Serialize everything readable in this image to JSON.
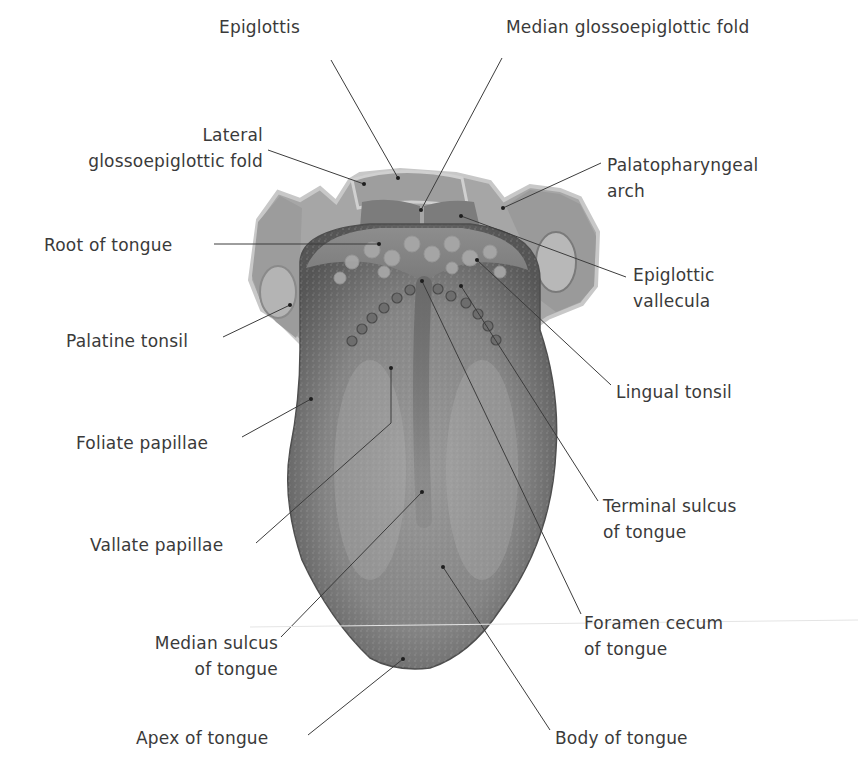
{
  "diagram": {
    "colors": {
      "background": "#ffffff",
      "text": "#3a3a3a",
      "leader_line": "#3c3c3c",
      "tongue_dark": "#5e5e5e",
      "tongue_mid": "#8a8a8a",
      "tongue_light": "#b9b9b9",
      "rim_light": "#d2d2d2"
    },
    "labels": [
      {
        "id": "epiglottis",
        "lines": [
          "Epiglottis"
        ],
        "anchor": [
          398,
          178
        ],
        "elbow": [
          331,
          60
        ],
        "text_pos": [
          219,
          14
        ],
        "align": "left"
      },
      {
        "id": "median-glossoepiglottic-fold",
        "lines": [
          "Median glossoepiglottic fold"
        ],
        "anchor": [
          421,
          210
        ],
        "elbow": [
          502,
          58
        ],
        "text_pos": [
          506,
          14
        ],
        "align": "left"
      },
      {
        "id": "lateral-glossoepiglottic-fold",
        "lines": [
          "Lateral",
          "glossoepiglottic fold"
        ],
        "anchor": [
          364,
          184
        ],
        "elbow": [
          268,
          150
        ],
        "text_pos": [
          0,
          122
        ],
        "align": "right",
        "right_edge": [
          263
        ]
      },
      {
        "id": "palatopharyngeal-arch",
        "lines": [
          "Palatopharyngeal",
          "arch"
        ],
        "anchor": [
          503,
          208
        ],
        "elbow": [
          601,
          163
        ],
        "text_pos": [
          607,
          152
        ],
        "align": "left"
      },
      {
        "id": "root-of-tongue",
        "lines": [
          "Root of tongue"
        ],
        "anchor": [
          379,
          244
        ],
        "elbow": [
          214,
          244
        ],
        "text_pos": [
          44,
          232
        ],
        "align": "left"
      },
      {
        "id": "epiglottic-vallecula",
        "lines": [
          "Epiglottic",
          "vallecula"
        ],
        "anchor": [
          461,
          216
        ],
        "elbow": [
          626,
          277
        ],
        "text_pos": [
          633,
          262
        ],
        "align": "left"
      },
      {
        "id": "palatine-tonsil",
        "lines": [
          "Palatine tonsil"
        ],
        "anchor": [
          290,
          305
        ],
        "elbow": [
          223,
          337
        ],
        "text_pos": [
          66,
          328
        ],
        "align": "left"
      },
      {
        "id": "lingual-tonsil",
        "lines": [
          "Lingual tonsil"
        ],
        "anchor": [
          477,
          260
        ],
        "elbow": [
          611,
          385
        ],
        "text_pos": [
          616,
          379
        ],
        "align": "left"
      },
      {
        "id": "foliate-papillae",
        "lines": [
          "Foliate papillae"
        ],
        "anchor": [
          311,
          399
        ],
        "elbow": [
          242,
          437
        ],
        "text_pos": [
          76,
          430
        ],
        "align": "left"
      },
      {
        "id": "vallate-papillae",
        "lines": [
          "Vallate papillae"
        ],
        "anchor": [
          391,
          368
        ],
        "elbow": [
          391,
          423
        ],
        "elbow2": [
          256,
          543
        ],
        "text_pos": [
          90,
          532
        ],
        "align": "left"
      },
      {
        "id": "terminal-sulcus-of-tongue",
        "lines": [
          "Terminal sulcus",
          "of tongue"
        ],
        "anchor": [
          461,
          286
        ],
        "elbow": [
          598,
          501
        ],
        "text_pos": [
          603,
          493
        ],
        "align": "left"
      },
      {
        "id": "median-sulcus-of-tongue",
        "lines": [
          "Median sulcus",
          "of tongue"
        ],
        "anchor": [
          422,
          492
        ],
        "elbow": [
          281,
          637
        ],
        "text_pos": [
          126,
          598
        ],
        "align": "right",
        "right_edge": [
          278
        ]
      },
      {
        "id": "foramen-cecum-of-tongue",
        "lines": [
          "Foramen cecum",
          "of tongue"
        ],
        "anchor": [
          422,
          281
        ],
        "elbow": [
          581,
          614
        ],
        "text_pos": [
          584,
          610
        ],
        "align": "left"
      },
      {
        "id": "body-of-tongue",
        "lines": [
          "Body of tongue"
        ],
        "anchor": [
          443,
          567
        ],
        "elbow": [
          550,
          730
        ],
        "text_pos": [
          555,
          725
        ],
        "align": "left"
      },
      {
        "id": "apex-of-tongue",
        "lines": [
          "Apex of tongue"
        ],
        "anchor": [
          403,
          659
        ],
        "elbow": [
          308,
          735
        ],
        "text_pos": [
          136,
          725
        ],
        "align": "left"
      }
    ]
  }
}
